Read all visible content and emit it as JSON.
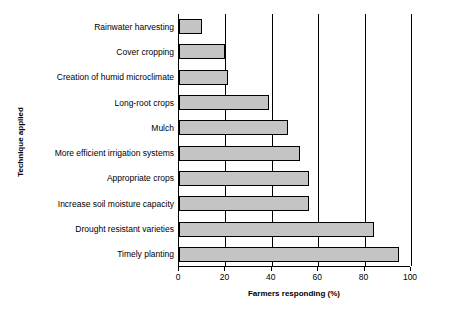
{
  "chart_data": {
    "type": "bar",
    "orientation": "horizontal",
    "title": "",
    "xlabel": "Farmers responding (%)",
    "ylabel": "Technique applied",
    "categories": [
      "Rainwater harvesting",
      "Cover cropping",
      "Creation of humid microclimate",
      "Long-root crops",
      "Mulch",
      "More efficient irrigation systems",
      "Appropriate crops",
      "Increase soil moisture capacity",
      "Drought resistant varieties",
      "Timely planting"
    ],
    "values": [
      10,
      20,
      21,
      39,
      47,
      52,
      56,
      56,
      84,
      95
    ],
    "xlim": [
      0,
      100
    ],
    "xticks": [
      0,
      20,
      40,
      60,
      80,
      100
    ],
    "xtick_labels": [
      "0",
      "20",
      "40",
      "60",
      "80",
      "100"
    ],
    "grid": "vertical",
    "bar_color": "#c4c4c4",
    "bar_edge_color": "#000000",
    "legend": null
  }
}
